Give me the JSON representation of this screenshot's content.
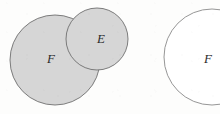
{
  "figure": {
    "kind": "set-diagram",
    "canvas": {
      "width": 220,
      "height": 114
    },
    "background_color": "#fdfdfc",
    "stroke_color": "#6f6f6f",
    "shaded_fill_color": "#d6d6d6",
    "unshaded_fill_color": "#ffffff",
    "label_color": "#2b2b2b"
  },
  "panels": [
    {
      "name": "left-panel",
      "shapes": [
        {
          "name": "circle-F-left",
          "label": "F",
          "shaded": true,
          "cx": 55,
          "cy": 60,
          "r": 45
        },
        {
          "name": "circle-E",
          "label": "E",
          "shaded": true,
          "cx": 97,
          "cy": 39,
          "r": 31
        }
      ]
    },
    {
      "name": "right-panel",
      "shapes": [
        {
          "name": "circle-F-right",
          "label": "F",
          "shaded": false,
          "cx": 212,
          "cy": 57,
          "r": 48
        }
      ]
    }
  ],
  "labels": {
    "f_left": "F",
    "e": "E",
    "f_right": "F"
  },
  "chart_data": {
    "type": "diagram",
    "diagram_type": "venn",
    "title": "",
    "sets": [
      {
        "id": "F_left",
        "label": "F",
        "panel": "left",
        "filled": true,
        "fill": "#d6d6d6",
        "cx": 55,
        "cy": 60,
        "r": 45
      },
      {
        "id": "E",
        "label": "E",
        "panel": "left",
        "filled": true,
        "fill": "#d6d6d6",
        "cx": 97,
        "cy": 39,
        "r": 31
      },
      {
        "id": "F_right",
        "label": "F",
        "panel": "right",
        "filled": false,
        "fill": "#ffffff",
        "cx": 212,
        "cy": 57,
        "r": 48
      }
    ],
    "intersections": [
      {
        "sets": [
          "F_left",
          "E"
        ],
        "shaded": true
      }
    ],
    "annotations": [
      "F",
      "E",
      "F"
    ],
    "legend": [],
    "grid": false
  }
}
